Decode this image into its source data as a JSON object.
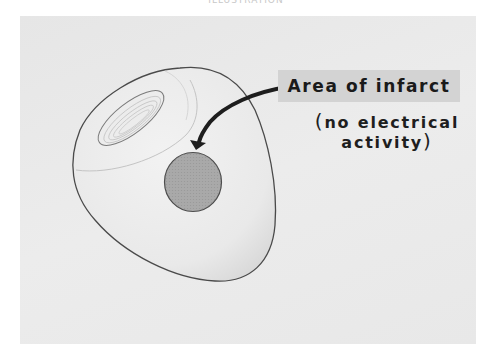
{
  "diagram": {
    "top_caption": "ILLUSTRATION",
    "label": {
      "title": "Area of infarct",
      "note_open": "(",
      "note_line1": "no electrical",
      "note_line2": "activity",
      "note_close": ")"
    },
    "parts": [
      "heart-ventricle-outline",
      "ventricle-opening",
      "infarct-area",
      "pointer-arrow"
    ],
    "colors": {
      "background": "#e8e8e8",
      "label_box": "#d3d3d3",
      "infarct_fill": "#a8a8a8",
      "outline": "#555555",
      "arrow": "#1e1e1e"
    }
  }
}
